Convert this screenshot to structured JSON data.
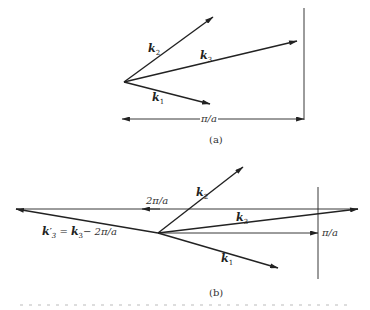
{
  "figure": {
    "part_a": {
      "caption": "(a)",
      "vectors": [
        {
          "name": "k1",
          "label": "k",
          "sub": "1"
        },
        {
          "name": "k2",
          "label": "k",
          "sub": "2"
        },
        {
          "name": "k3",
          "label": "k",
          "sub": "3"
        }
      ],
      "zone_boundary_label": "π/a"
    },
    "part_b": {
      "caption": "(b)",
      "vectors": [
        {
          "name": "k1",
          "label": "k",
          "sub": "1"
        },
        {
          "name": "k2",
          "label": "k",
          "sub": "2"
        },
        {
          "name": "k3",
          "label": "k",
          "sub": "3"
        }
      ],
      "reciprocal_shift_label": "2π/a",
      "zone_boundary_label": "π/a",
      "folded_vector_label": {
        "lhs": "k",
        "lhs_prime": "′",
        "lhs_sub": "3",
        "eq": " = ",
        "rhs": "k",
        "rhs_sub": "3",
        "rest": "− 2π/a"
      }
    },
    "colors": {
      "line": "#222222",
      "background": "#ffffff"
    }
  }
}
